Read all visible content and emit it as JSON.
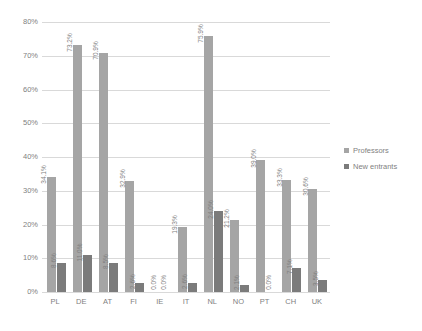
{
  "chart_data": {
    "type": "bar",
    "title": "",
    "subtitle": "",
    "xlabel": "",
    "ylabel": "",
    "ylim": [
      0,
      80
    ],
    "ytick_labels": [
      "0%",
      "10%",
      "20%",
      "30%",
      "40%",
      "50%",
      "60%",
      "70%",
      "80%"
    ],
    "ytick_values": [
      0,
      10,
      20,
      30,
      40,
      50,
      60,
      70,
      80
    ],
    "grid": true,
    "legend_position": "right",
    "categories": [
      "PL",
      "DE",
      "AT",
      "FI",
      "IE",
      "IT",
      "NL",
      "NO",
      "PT",
      "CH",
      "UK"
    ],
    "series": [
      {
        "name": "Professors",
        "color": "#a5a5a5",
        "values": [
          34.1,
          73.2,
          70.9,
          32.9,
          0.0,
          19.3,
          75.9,
          21.2,
          39.0,
          33.3,
          30.6
        ],
        "labels": [
          "34.1%",
          "73.2%",
          "70.9%",
          "32.9%",
          "0.0%",
          "19.3%",
          "75.9%",
          "21.2%",
          "39.0%",
          "33.3%",
          "30.6%"
        ]
      },
      {
        "name": "New entrants",
        "color": "#7b7b7b",
        "values": [
          8.6,
          11.0,
          8.5,
          2.6,
          0.0,
          2.6,
          24.0,
          2.1,
          0.0,
          7.1,
          3.5
        ],
        "labels": [
          "8.6%",
          "11.0%",
          "8.5%",
          "2.6%",
          "0.0%",
          "2.6%",
          "24.0%",
          "2.1%",
          "0.0%",
          "7.1%",
          "3.5%"
        ]
      }
    ]
  },
  "legend": {
    "items": [
      {
        "label": "Professors"
      },
      {
        "label": "New entrants"
      }
    ]
  }
}
